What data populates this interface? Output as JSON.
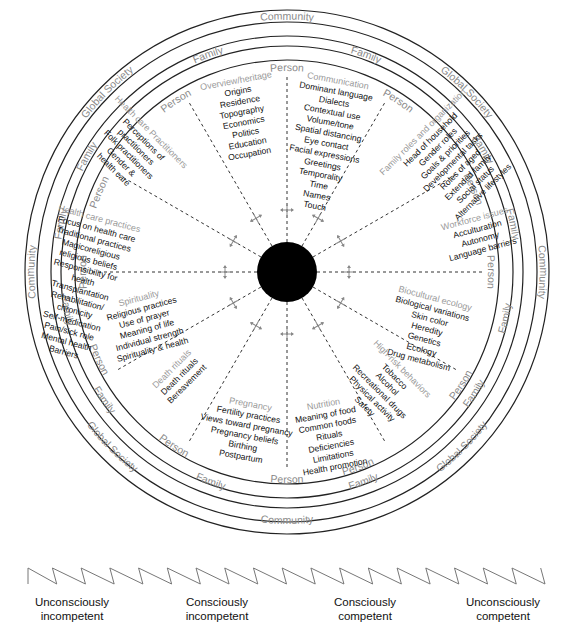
{
  "diagram": {
    "rings": {
      "outer_labels": [
        {
          "text": "Community",
          "angle": 0
        },
        {
          "text": "Global Society",
          "angle": 45
        },
        {
          "text": "Community",
          "angle": 90
        },
        {
          "text": "Global Society",
          "angle": 135
        },
        {
          "text": "Community",
          "angle": 180
        },
        {
          "text": "Global Society",
          "angle": 225
        },
        {
          "text": "Community",
          "angle": 270
        },
        {
          "text": "Global Society",
          "angle": 315
        }
      ],
      "middle_labels": [
        {
          "text": "Family",
          "angle": -20
        },
        {
          "text": "Family",
          "angle": 20
        },
        {
          "text": "Family",
          "angle": 58
        },
        {
          "text": "Family",
          "angle": 78
        },
        {
          "text": "Family",
          "angle": 102
        },
        {
          "text": "Family",
          "angle": 123
        },
        {
          "text": "Family",
          "angle": 160
        },
        {
          "text": "Family",
          "angle": 200
        },
        {
          "text": "Family",
          "angle": 235
        },
        {
          "text": "Family",
          "angle": 260
        },
        {
          "text": "Family",
          "angle": 282
        },
        {
          "text": "Family",
          "angle": 300
        }
      ],
      "inner_labels": [
        {
          "text": "Person",
          "angle": 0
        },
        {
          "text": "Person",
          "angle": 33
        },
        {
          "text": "Person",
          "angle": 66
        },
        {
          "text": "Person",
          "angle": 90
        },
        {
          "text": "Person",
          "angle": 123
        },
        {
          "text": "Person",
          "angle": 160
        },
        {
          "text": "Person",
          "angle": 180
        },
        {
          "text": "Person",
          "angle": 213
        },
        {
          "text": "Person",
          "angle": 245
        },
        {
          "text": "Person",
          "angle": 270
        },
        {
          "text": "Person",
          "angle": 293
        },
        {
          "text": "Person",
          "angle": 327
        }
      ]
    },
    "domains": [
      {
        "title": "Overview/heritage",
        "items": [
          "Origins",
          "Residence",
          "Topography",
          "Economics",
          "Politics",
          "Education",
          "Occupation"
        ]
      },
      {
        "title": "Communication",
        "items": [
          "Dominant language",
          "Dialects",
          "Contextual use",
          "Volume/tone",
          "Spatial distancing",
          "Eye contact",
          "Facial expressions",
          "Greetings",
          "Temporality",
          "Time",
          "Names",
          "Touch"
        ]
      },
      {
        "title": "Family roles and organization",
        "items": [
          "Head of household",
          "Gender roles",
          "Goals & priorities",
          "Developmental tasks",
          "Roles of aged",
          "Extended family",
          "Social status",
          "Alternative lifestyles"
        ]
      },
      {
        "title": "Workforce issues",
        "items": [
          "Acculturation",
          "Autonomy",
          "Language barriers"
        ]
      },
      {
        "title": "Biocultural ecology",
        "items": [
          "Biological variations",
          "Skin color",
          "Heredity",
          "Genetics",
          "Ecology",
          "Drug metabolism"
        ]
      },
      {
        "title": "High-risk behaviors",
        "items": [
          "Tobacco",
          "Alcohol",
          "Recreational drugs",
          "Physical activity",
          "Safety"
        ]
      },
      {
        "title": "Nutrition",
        "items": [
          "Meaning of food",
          "Common foods",
          "Rituals",
          "Deficiencies",
          "Limitations",
          "Health promotion"
        ]
      },
      {
        "title": "Pregnancy",
        "items": [
          "Fertility practices",
          "Views toward pregnancy",
          "Pregnancy beliefs",
          "Birthing",
          "Postpartum"
        ]
      },
      {
        "title": "Death rituals",
        "items": [
          "Death rituals",
          "Bereavement"
        ]
      },
      {
        "title": "Spirituality",
        "items": [
          "Religious practices",
          "Use of prayer",
          "Meaning of life",
          "Individual strength",
          "Spirituality & health"
        ]
      },
      {
        "title": "Health care practices",
        "items": [
          "Focus on health care",
          "Traditional practices",
          "Magicoreligious",
          "religious beliefs",
          "Responsibility for",
          "health",
          "Transplantation",
          "Rehabilitation/",
          "chronicity",
          "Self-medication",
          "Pain/sick role",
          "Mental health",
          "Barriers"
        ]
      },
      {
        "title": "Health care Practitioners",
        "items": [
          "Perceptions of",
          "practitioners",
          "Folk practitioners",
          "Gender &",
          "health care"
        ]
      }
    ],
    "center": {
      "fill": "#000000"
    },
    "colors": {
      "ring_label": "#8a8a8a",
      "domain_title": "#9a9a9a",
      "item_text": "#111111",
      "line": "#222222"
    }
  },
  "competence_scale": {
    "stages": [
      {
        "line1": "Unconsciously",
        "line2": "incompetent"
      },
      {
        "line1": "Consciously",
        "line2": "incompetent"
      },
      {
        "line1": "Consciously",
        "line2": "competent"
      },
      {
        "line1": "Unconsciously",
        "line2": "competent"
      }
    ]
  }
}
